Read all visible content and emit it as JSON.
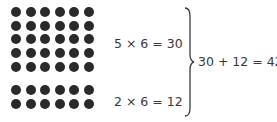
{
  "groups": [
    {
      "rows": 5,
      "cols": 6,
      "equation": "5 × 6 = 30"
    },
    {
      "rows": 2,
      "cols": 6,
      "equation": "2 × 6 = 12"
    }
  ],
  "sum_equation": "30 + 12 = 42",
  "colors": {
    "dot": "#2a2a2a",
    "text": "#3a3a3a",
    "brace": "#3a3a3a"
  }
}
